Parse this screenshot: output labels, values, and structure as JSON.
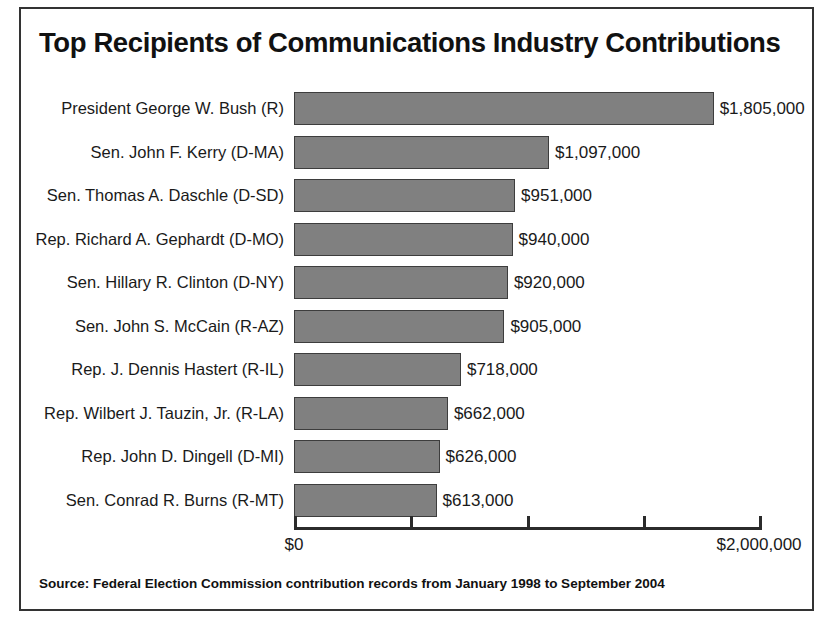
{
  "chart_data": {
    "type": "bar",
    "orientation": "horizontal",
    "title": "Top Recipients of Communications Industry Contributions",
    "xlabel": "",
    "ylabel": "",
    "xlim": [
      0,
      2000000
    ],
    "grid": false,
    "legend": null,
    "categories": [
      "President George W. Bush (R)",
      "Sen. John F. Kerry (D-MA)",
      "Sen. Thomas A. Daschle (D-SD)",
      "Rep. Richard A. Gephardt (D-MO)",
      "Sen. Hillary R. Clinton (D-NY)",
      "Sen. John S. McCain (R-AZ)",
      "Rep. J. Dennis Hastert (R-IL)",
      "Rep. Wilbert J. Tauzin, Jr. (R-LA)",
      "Rep. John D. Dingell (D-MI)",
      "Sen. Conrad R. Burns (R-MT)"
    ],
    "values": [
      1805000,
      1097000,
      951000,
      940000,
      920000,
      905000,
      718000,
      662000,
      626000,
      613000
    ],
    "value_labels": [
      "$1,805,000",
      "$1,097,000",
      "$951,000",
      "$940,000",
      "$920,000",
      "$905,000",
      "$718,000",
      "$662,000",
      "$626,000",
      "$613,000"
    ],
    "xticks": [
      0,
      500000,
      1000000,
      1500000,
      2000000
    ],
    "xtick_labels": [
      "$0",
      "",
      "",
      "",
      "$2,000,000"
    ],
    "bar_color": "#808080",
    "bar_edge_color": "#3d3d3d",
    "axis_color": "#2b2b2b",
    "background_color": "#ffffff",
    "text_color": "#1a1a1a"
  },
  "source": {
    "note": "Source: Federal Election Commission contribution records from January 1998 to September 2004"
  }
}
